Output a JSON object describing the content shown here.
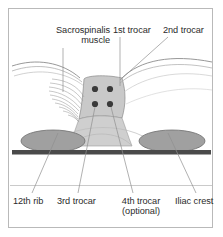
{
  "figure": {
    "border_color": "#b9b9b9",
    "background": "#ffffff"
  },
  "labels": {
    "sacrospinalis": "Sacrospinalis\nmuscle",
    "sacrospinalis_line1": "Sacrospinalis",
    "sacrospinalis_line2": "muscle",
    "first_trocar": "1st trocar",
    "second_trocar": "2nd trocar",
    "twelfth_rib": "12th rib",
    "third_trocar": "3rd trocar",
    "fourth_trocar": "4th trocar\n(optional)",
    "fourth_trocar_line1": "4th trocar",
    "fourth_trocar_line2": "(optional)",
    "iliac_crest": "Iliac crest"
  },
  "anatomy": {
    "muscle_fill": "#c9c9c9",
    "bone_fill": "#a0a0a0",
    "bone_stroke": "#6e6e6e",
    "table_bar_color": "#4a4a4a",
    "skin_stroke": "#8c8c8c",
    "striation_stroke": "#9a9a9a",
    "leader_stroke": "#8f8f8f",
    "trocar_dot_color": "#3a3a3a",
    "baseline_color": "#c4c4c4"
  },
  "trocars": [
    {
      "name": "1st trocar",
      "x": 95,
      "y": 89,
      "r": 3.1
    },
    {
      "name": "2nd trocar",
      "x": 110,
      "y": 89,
      "r": 3.1
    },
    {
      "name": "3rd trocar",
      "x": 95,
      "y": 104,
      "r": 3.1
    },
    {
      "name": "4th trocar",
      "x": 110,
      "y": 104,
      "r": 3.1
    }
  ],
  "bones": [
    {
      "name": "12th rib",
      "cx": 53,
      "cy": 141,
      "rx": 32,
      "ry": 11
    },
    {
      "name": "Iliac crest",
      "cx": 172,
      "cy": 141,
      "rx": 33,
      "ry": 11
    }
  ]
}
